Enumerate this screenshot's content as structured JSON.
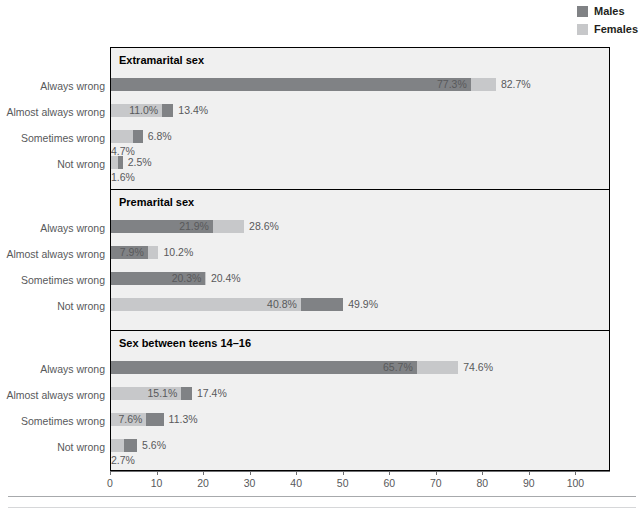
{
  "legend": {
    "items": [
      {
        "label": "Males",
        "color": "#808285",
        "icon": "legend-swatch-males"
      },
      {
        "label": "Females",
        "color": "#c7c8ca",
        "icon": "legend-swatch-females"
      }
    ]
  },
  "colors": {
    "males": "#808285",
    "females": "#c7c8ca",
    "panel_background": "#f0f0f0",
    "frame": "#000000",
    "text": "#58595b",
    "title": "#000000"
  },
  "axis": {
    "min": 0,
    "max": 107,
    "ticks": [
      0,
      10,
      20,
      30,
      40,
      50,
      60,
      70,
      80,
      90,
      100
    ],
    "tick_labels": [
      "0",
      "10",
      "20",
      "30",
      "40",
      "50",
      "60",
      "70",
      "80",
      "90",
      "100"
    ]
  },
  "chart_data": {
    "type": "bar",
    "orientation": "horizontal",
    "title": "",
    "xlabel": "",
    "ylabel": "",
    "xlim": [
      0,
      107
    ],
    "grid": false,
    "legend_position": "top-right",
    "categories": [
      "Always wrong",
      "Almost always wrong",
      "Sometimes wrong",
      "Not wrong"
    ],
    "series_names": [
      "Males",
      "Females"
    ],
    "panels": [
      {
        "title": "Extramarital sex",
        "rows": [
          {
            "category": "Always wrong",
            "males": 77.3,
            "females": 82.7,
            "males_label": "77.3%",
            "females_label": "82.7%"
          },
          {
            "category": "Almost always wrong",
            "males": 13.4,
            "females": 11.0,
            "males_label": "13.4%",
            "females_label": "11.0%"
          },
          {
            "category": "Sometimes wrong",
            "males": 6.8,
            "females": 4.7,
            "males_label": "6.8%",
            "females_label": "4.7%"
          },
          {
            "category": "Not wrong",
            "males": 2.5,
            "females": 1.6,
            "males_label": "2.5%",
            "females_label": "1.6%"
          }
        ]
      },
      {
        "title": "Premarital sex",
        "rows": [
          {
            "category": "Always wrong",
            "males": 21.9,
            "females": 28.6,
            "males_label": "21.9%",
            "females_label": "28.6%"
          },
          {
            "category": "Almost always wrong",
            "males": 7.9,
            "females": 10.2,
            "males_label": "7.9%",
            "females_label": "10.2%"
          },
          {
            "category": "Sometimes wrong",
            "males": 20.3,
            "females": 20.4,
            "males_label": "20.3%",
            "females_label": "20.4%"
          },
          {
            "category": "Not wrong",
            "males": 49.9,
            "females": 40.8,
            "males_label": "49.9%",
            "females_label": "40.8%"
          }
        ]
      },
      {
        "title": "Sex between teens 14–16",
        "rows": [
          {
            "category": "Always wrong",
            "males": 65.7,
            "females": 74.6,
            "males_label": "65.7%",
            "females_label": "74.6%"
          },
          {
            "category": "Almost always wrong",
            "males": 17.4,
            "females": 15.1,
            "males_label": "17.4%",
            "females_label": "15.1%"
          },
          {
            "category": "Sometimes wrong",
            "males": 11.3,
            "females": 7.6,
            "males_label": "11.3%",
            "females_label": "7.6%"
          },
          {
            "category": "Not wrong",
            "males": 5.6,
            "females": 2.7,
            "males_label": "5.6%",
            "females_label": "2.7%"
          }
        ]
      }
    ]
  }
}
